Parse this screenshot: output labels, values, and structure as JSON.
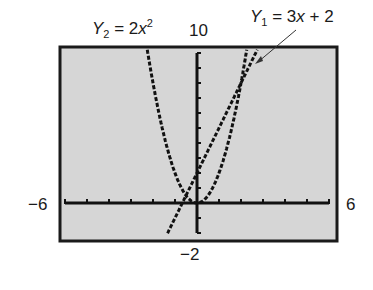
{
  "labels": {
    "y2_name": "Y",
    "y2_sub": "2",
    "y2_eq": " = 2",
    "y2_var": "x",
    "y2_exp": "2",
    "y1_name": "Y",
    "y1_sub": "1",
    "y1_eq": " = 3",
    "y1_var": "x",
    "y1_rest": " + 2",
    "ymax": "10",
    "ymin": "−2",
    "xmin": "−6",
    "xmax": "6"
  },
  "colors": {
    "screen_bg": "#d6d6d6",
    "ink": "#111111",
    "frame": "#1a1a1a"
  },
  "chart_data": {
    "type": "line",
    "title": "",
    "series": [
      {
        "name": "Y1 = 3x + 2",
        "expression": "3x + 2",
        "style": "dotted"
      },
      {
        "name": "Y2 = 2x^2",
        "expression": "2x^2",
        "style": "dotted"
      }
    ],
    "xlim": [
      -6,
      6
    ],
    "ylim": [
      -2,
      10
    ],
    "xscale": 1,
    "yscale": 1,
    "tick_labels": {
      "xmin": "-6",
      "xmax": "6",
      "ymin": "-2",
      "ymax": "10"
    },
    "intersections": [
      [
        -0.5,
        0.5
      ],
      [
        2,
        8
      ]
    ],
    "grid": false,
    "annotations": [
      "Y2 = 2x^2",
      "Y1 = 3x + 2 (arrow pointing to line)"
    ]
  }
}
